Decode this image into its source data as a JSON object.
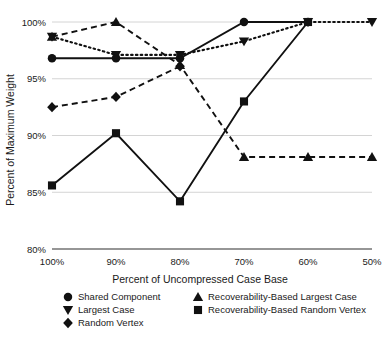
{
  "chart_data": {
    "type": "line",
    "title": "",
    "xlabel": "Percent of Uncompressed Case Base",
    "ylabel": "Percent of Maximum Weight",
    "categories": [
      "100%",
      "90%",
      "80%",
      "70%",
      "60%",
      "50%"
    ],
    "x_tick_labels": [
      "100%",
      "90%",
      "80%",
      "70%",
      "60%",
      "50%"
    ],
    "y_tick_labels": [
      "100%",
      "95%",
      "90%",
      "85%",
      "80%"
    ],
    "y_ticks": [
      100,
      95,
      90,
      85,
      80
    ],
    "ylim": [
      80,
      100
    ],
    "grid": true,
    "legend_position": "bottom",
    "series": [
      {
        "name": "Shared Component",
        "marker": "circle",
        "linestyle": "solid",
        "values": [
          96.8,
          96.8,
          96.8,
          100.0,
          100.0,
          null
        ]
      },
      {
        "name": "Largest Case",
        "marker": "triangle-down",
        "linestyle": "dotted",
        "values": [
          98.7,
          97.1,
          97.1,
          98.3,
          100.0,
          100.0
        ]
      },
      {
        "name": "Random Vertex",
        "marker": "diamond",
        "linestyle": "dashed",
        "values": [
          92.5,
          93.4,
          96.1,
          null,
          null,
          null
        ]
      },
      {
        "name": "Recoverability-Based Largest Case",
        "marker": "triangle-up",
        "linestyle": "dashed",
        "values": [
          98.7,
          100.0,
          96.2,
          88.1,
          88.1,
          88.1
        ]
      },
      {
        "name": "Recoverability-Based Random Vertex",
        "marker": "square",
        "linestyle": "solid",
        "values": [
          85.6,
          90.2,
          84.2,
          93.0,
          100.0,
          null
        ]
      }
    ]
  },
  "axes": {
    "y_title": "Percent of Maximum Weight",
    "x_title": "Percent of Uncompressed Case Base"
  },
  "legend": {
    "entries": [
      {
        "label": "Shared Component",
        "marker": "circle"
      },
      {
        "label": "Recoverability-Based Largest Case",
        "marker": "triangle-up"
      },
      {
        "label": "Largest Case",
        "marker": "triangle-down"
      },
      {
        "label": "Recoverability-Based Random Vertex",
        "marker": "square"
      },
      {
        "label": "Random Vertex",
        "marker": "diamond"
      }
    ]
  },
  "colors": {
    "series": "#111111",
    "grid": "#c9c9c9",
    "axis": "#7a7a7a",
    "text": "#1a1a1a",
    "background": "#ffffff"
  }
}
